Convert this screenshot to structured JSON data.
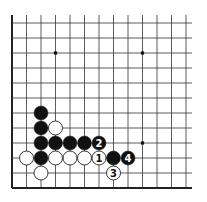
{
  "diagram": {
    "type": "go-board-fragment",
    "corner": "lower-left",
    "grid": {
      "columns": 13,
      "rows": 12,
      "origin_x": 12,
      "bottom_y": 188,
      "spacing_x": 14.5,
      "spacing_y": 15,
      "line_color": "#333333",
      "edge_color": "#222222"
    },
    "star_points": [
      {
        "col": 3,
        "row": 9
      },
      {
        "col": 9,
        "row": 9
      },
      {
        "col": 9,
        "row": 3
      }
    ],
    "stones": [
      {
        "color": "black",
        "col": 2,
        "row": 5,
        "label": ""
      },
      {
        "color": "black",
        "col": 2,
        "row": 4,
        "label": ""
      },
      {
        "color": "white",
        "col": 3,
        "row": 4,
        "label": ""
      },
      {
        "color": "black",
        "col": 2,
        "row": 3,
        "label": ""
      },
      {
        "color": "black",
        "col": 3,
        "row": 3,
        "label": ""
      },
      {
        "color": "black",
        "col": 4,
        "row": 3,
        "label": ""
      },
      {
        "color": "black",
        "col": 5,
        "row": 3,
        "label": ""
      },
      {
        "color": "black",
        "col": 6,
        "row": 3,
        "label": "2"
      },
      {
        "color": "white",
        "col": 1,
        "row": 2,
        "label": ""
      },
      {
        "color": "black",
        "col": 2,
        "row": 2,
        "label": ""
      },
      {
        "color": "white",
        "col": 3,
        "row": 2,
        "label": ""
      },
      {
        "color": "white",
        "col": 4,
        "row": 2,
        "label": ""
      },
      {
        "color": "white",
        "col": 5,
        "row": 2,
        "label": ""
      },
      {
        "color": "white",
        "col": 6,
        "row": 2,
        "label": "1"
      },
      {
        "color": "black",
        "col": 7,
        "row": 2,
        "label": ""
      },
      {
        "color": "black",
        "col": 8,
        "row": 2,
        "label": "4"
      },
      {
        "color": "white",
        "col": 2,
        "row": 1,
        "label": ""
      },
      {
        "color": "white",
        "col": 7,
        "row": 1,
        "label": "3"
      }
    ]
  }
}
